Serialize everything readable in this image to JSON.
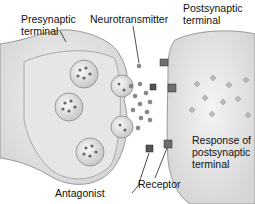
{
  "labels": {
    "presynaptic": "Presynaptic\nterminal",
    "neurotransmitter": "Neurotransmitter",
    "postsynaptic": "Postsynaptic\nterminal",
    "response": "Response of\npostsynaptic\nterminal",
    "receptor": "Receptor",
    "antagonist": "Antagonist"
  }
}
